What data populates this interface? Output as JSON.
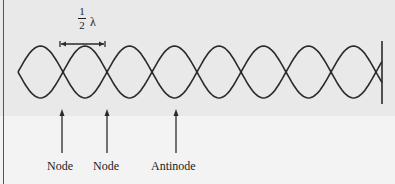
{
  "diagram": {
    "spacing_label": {
      "numerator": "1",
      "denominator": "2",
      "symbol": "λ"
    },
    "labels": [
      {
        "text": "Node",
        "x": 63
      },
      {
        "text": "Node",
        "x": 107
      },
      {
        "text": "Antinode",
        "x": 175
      }
    ],
    "wave": {
      "node_x": [
        18,
        63,
        107,
        152,
        197,
        241,
        286,
        331,
        376
      ],
      "center_y": 72,
      "amplitude": 26,
      "wall_x": 382
    },
    "colors": {
      "stroke": "#2a2a2a",
      "background": "#e9e9e9"
    }
  }
}
